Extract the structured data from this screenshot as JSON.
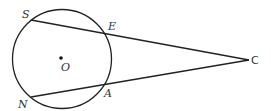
{
  "diagram": {
    "type": "geometry",
    "colors": {
      "stroke": "#222222",
      "label": "#333333",
      "background": "#ffffff"
    },
    "circle": {
      "center_label": "O",
      "cx": 62,
      "cy": 59,
      "r": 50
    },
    "points": {
      "S": {
        "label": "S",
        "x": 31,
        "y": 20
      },
      "E": {
        "label": "E",
        "x": 106,
        "y": 32
      },
      "N": {
        "label": "N",
        "x": 31,
        "y": 97
      },
      "A": {
        "label": "A",
        "x": 106,
        "y": 87
      },
      "C": {
        "label": "C",
        "x": 249,
        "y": 60
      },
      "O": {
        "label": "O",
        "x": 61,
        "y": 58
      }
    },
    "segments": [
      {
        "from": "S",
        "to": "C",
        "name": "secant-SC"
      },
      {
        "from": "N",
        "to": "C",
        "name": "secant-NC"
      }
    ]
  }
}
